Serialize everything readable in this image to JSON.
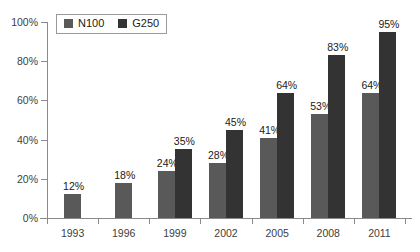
{
  "chart_data": {
    "type": "bar",
    "title": "",
    "subtitle": "",
    "xlabel": "",
    "ylabel": "",
    "categories": [
      "1993",
      "1996",
      "1999",
      "2002",
      "2005",
      "2008",
      "2011"
    ],
    "series": [
      {
        "name": "N100",
        "color": "#595959",
        "values": [
          12,
          18,
          24,
          28,
          41,
          53,
          64
        ],
        "labels": [
          "12%",
          "18%",
          "24%",
          "28%",
          "41%",
          "53%",
          "64%"
        ]
      },
      {
        "name": "G250",
        "color": "#333333",
        "values": [
          null,
          null,
          35,
          45,
          64,
          83,
          95
        ],
        "labels": [
          "",
          "",
          "35%",
          "45%",
          "64%",
          "83%",
          "95%"
        ]
      }
    ],
    "ylim": [
      0,
      100
    ],
    "yticks": [
      0,
      20,
      40,
      60,
      80,
      100
    ],
    "ytick_labels": [
      "0%",
      "20%",
      "40%",
      "60%",
      "80%",
      "100%"
    ],
    "grid": false,
    "legend_position": "top-left",
    "annotations": []
  },
  "legend": {
    "entries": [
      {
        "label": "N100",
        "color": "#595959"
      },
      {
        "label": "G250",
        "color": "#333333"
      }
    ]
  },
  "axis": {
    "y_tick_labels": [
      "100%",
      "80%",
      "60%",
      "40%",
      "20%",
      "0%"
    ],
    "x_tick_labels": [
      "1993",
      "1996",
      "1999",
      "2002",
      "2005",
      "2008",
      "2011"
    ]
  },
  "colors": {
    "series_n100": "#595959",
    "series_g250": "#333333",
    "axis": "#8a8a8a",
    "text": "#404040",
    "background": "#ffffff"
  }
}
